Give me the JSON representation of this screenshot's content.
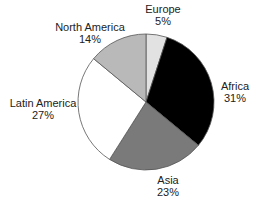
{
  "chart_data": {
    "type": "pie",
    "title": "",
    "start_angle_deg": 0,
    "direction": "clockwise",
    "slices": [
      {
        "label": "Europe",
        "value": 5,
        "display": "5%",
        "color": "#e2e2e2",
        "label_pos": [
          163,
          3
        ]
      },
      {
        "label": "Africa",
        "value": 31,
        "display": "31%",
        "color": "#000000",
        "label_pos": [
          235,
          80
        ]
      },
      {
        "label": "Asia",
        "value": 23,
        "display": "23%",
        "color": "#7a7a7a",
        "label_pos": [
          168,
          174
        ]
      },
      {
        "label": "Latin America",
        "value": 27,
        "display": "27%",
        "color": "#ffffff",
        "label_pos": [
          43,
          97
        ]
      },
      {
        "label": "North America",
        "value": 14,
        "display": "14%",
        "color": "#b9b9b9",
        "label_pos": [
          90,
          21
        ]
      }
    ]
  },
  "geometry": {
    "cx": 146,
    "cy": 102,
    "r": 68
  }
}
